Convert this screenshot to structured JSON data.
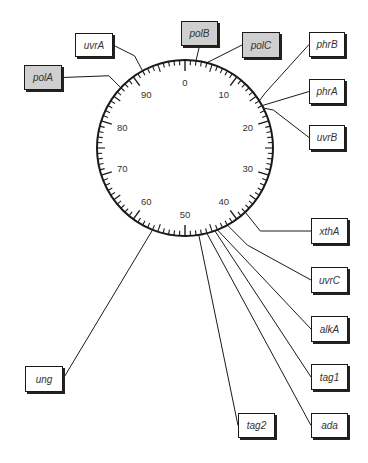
{
  "diagram": {
    "type": "circular genetic map",
    "center": [
      185,
      148
    ],
    "radius": 88,
    "scale": {
      "min": 0,
      "max": 100,
      "major_labels": [
        "0",
        "10",
        "20",
        "30",
        "40",
        "50",
        "60",
        "70",
        "80",
        "90"
      ]
    },
    "colors": {
      "line": "#1a1a1a",
      "highlight_box": "#cfcfcf",
      "box": "#ffffff",
      "text": "#333333"
    },
    "genes": [
      {
        "id": "polB",
        "label": "polB",
        "position": 2,
        "style": "gray",
        "box": [
          181,
          21,
          37,
          25
        ]
      },
      {
        "id": "polC",
        "label": "polC",
        "position": 4,
        "style": "gray",
        "box": [
          242,
          32,
          38,
          26
        ]
      },
      {
        "id": "uvrA",
        "label": "uvrA",
        "position": 92,
        "style": "white",
        "box": [
          75,
          33,
          38,
          24
        ]
      },
      {
        "id": "polA",
        "label": "polA",
        "position": 87,
        "style": "gray",
        "box": [
          24,
          65,
          38,
          25
        ]
      },
      {
        "id": "phrB",
        "label": "phrB",
        "position": 16,
        "style": "white",
        "box": [
          309,
          32,
          36,
          25
        ]
      },
      {
        "id": "phrA",
        "label": "phrA",
        "position": 17,
        "style": "white",
        "box": [
          309,
          79,
          36,
          25
        ]
      },
      {
        "id": "uvrB",
        "label": "uvrB",
        "position": 17.5,
        "style": "white",
        "box": [
          309,
          125,
          36,
          25
        ]
      },
      {
        "id": "xthA",
        "label": "xthA",
        "position": 38,
        "style": "white",
        "box": [
          311,
          218,
          37,
          26
        ]
      },
      {
        "id": "uvrC",
        "label": "uvrC",
        "position": 42,
        "style": "white",
        "box": [
          311,
          267,
          37,
          26
        ]
      },
      {
        "id": "alkA",
        "label": "alkA",
        "position": 44,
        "style": "white",
        "box": [
          311,
          316,
          37,
          26
        ]
      },
      {
        "id": "tag1",
        "label": "tag1",
        "position": 44.5,
        "style": "white",
        "box": [
          311,
          364,
          37,
          26
        ]
      },
      {
        "id": "ada",
        "label": "ada",
        "position": 46,
        "style": "white",
        "box": [
          311,
          413,
          37,
          25
        ]
      },
      {
        "id": "tag2",
        "label": "tag2",
        "position": 47.5,
        "style": "white",
        "box": [
          238,
          413,
          37,
          25
        ]
      },
      {
        "id": "ung",
        "label": "ung",
        "position": 56,
        "style": "white",
        "box": [
          25,
          366,
          38,
          26
        ]
      }
    ]
  }
}
